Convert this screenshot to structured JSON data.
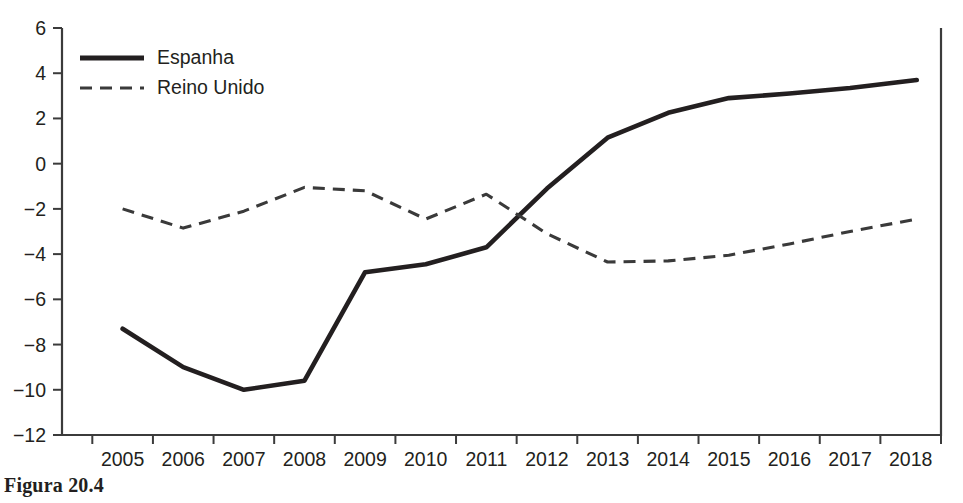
{
  "caption": "Figura 20.4",
  "chart_data": {
    "type": "line",
    "title": "",
    "xlabel": "",
    "ylabel": "",
    "xlim": [
      2004.5,
      2019.0
    ],
    "ylim": [
      -12,
      6
    ],
    "yticks": [
      6,
      4,
      2,
      0,
      -2,
      -4,
      -6,
      -8,
      -10,
      -12
    ],
    "ytick_labels": [
      "6",
      "4",
      "2",
      "0",
      "−2",
      "−4",
      "−6",
      "−8",
      "−10",
      "−12"
    ],
    "xticks": [
      2005,
      2006,
      2007,
      2008,
      2009,
      2010,
      2011,
      2012,
      2013,
      2014,
      2015,
      2016,
      2017,
      2018,
      2019
    ],
    "xtick_labels": [
      "2005",
      "2006",
      "2007",
      "2008",
      "2009",
      "2010",
      "2011",
      "2012",
      "2013",
      "2014",
      "2015",
      "2016",
      "2017",
      "2018"
    ],
    "grid": false,
    "legend_position": "top-left",
    "x": [
      2005.5,
      2006.5,
      2007.5,
      2008.5,
      2009.5,
      2010.5,
      2011.5,
      2012.5,
      2013.5,
      2014.5,
      2015.5,
      2016.5,
      2017.5,
      2018.6
    ],
    "series": [
      {
        "name": "Espanha",
        "style": "solid",
        "color": "#231f20",
        "values": [
          -7.3,
          -9.0,
          -10.0,
          -9.6,
          -4.8,
          -4.45,
          -3.7,
          -1.1,
          1.15,
          2.25,
          2.9,
          3.1,
          3.35,
          3.7
        ]
      },
      {
        "name": "Reino Unido",
        "style": "dashed",
        "color": "#3a3a3a",
        "values": [
          -2.0,
          -2.85,
          -2.1,
          -1.05,
          -1.2,
          -2.45,
          -1.35,
          -3.1,
          -4.35,
          -4.3,
          -4.05,
          -3.55,
          -3.0,
          -2.45
        ]
      }
    ]
  },
  "legend": {
    "entries": [
      {
        "label": "Espanha",
        "style": "solid"
      },
      {
        "label": "Reino Unido",
        "style": "dashed"
      }
    ]
  }
}
